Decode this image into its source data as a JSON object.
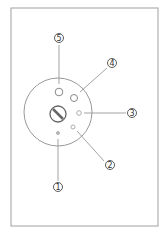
{
  "diagram": {
    "frame": {
      "x": 11,
      "y": 8,
      "w": 147,
      "h": 218,
      "stroke": "#9a9a9a"
    },
    "plate": {
      "cx": 58,
      "cy": 112,
      "r": 34,
      "stroke": "#9a9a9a"
    },
    "screw": {
      "cx": 58,
      "cy": 114,
      "r": 8
    },
    "holes": [
      {
        "id": "1",
        "cx": 58,
        "cy": 133,
        "r": 1.6
      },
      {
        "id": "2",
        "cx": 73,
        "cy": 127,
        "r": 2
      },
      {
        "id": "3",
        "cx": 79,
        "cy": 113,
        "r": 2.3
      },
      {
        "id": "4",
        "cx": 74,
        "cy": 98,
        "r": 3.5
      },
      {
        "id": "5",
        "cx": 59,
        "cy": 92,
        "r": 3.8
      }
    ],
    "callouts": [
      {
        "label": "1",
        "lx": 58,
        "ly": 187
      },
      {
        "label": "2",
        "lx": 110,
        "ly": 165
      },
      {
        "label": "3",
        "lx": 132,
        "ly": 113
      },
      {
        "label": "4",
        "lx": 112,
        "ly": 63
      },
      {
        "label": "5",
        "lx": 59,
        "ly": 38
      }
    ]
  }
}
